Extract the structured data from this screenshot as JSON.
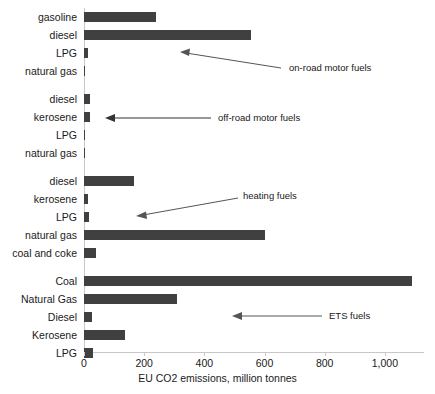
{
  "chart_data": {
    "type": "bar",
    "orientation": "horizontal",
    "title": "",
    "xlabel": "EU CO2 emissions, million tonnes",
    "ylabel": "",
    "xlim": [
      0,
      1130
    ],
    "xticks": [
      0,
      200,
      400,
      600,
      800,
      1000
    ],
    "xtick_labels": [
      "0",
      "200",
      "400",
      "600",
      "800",
      "1,000"
    ],
    "grid": false,
    "legend": null,
    "bar_color": "#404040",
    "axis_color": "#c8c8c8",
    "groups": [
      {
        "name": "on-road motor fuels",
        "categories": [
          "gasoline",
          "diesel",
          "LPG",
          "natural gas"
        ],
        "values": [
          240,
          555,
          12,
          3
        ]
      },
      {
        "name": "off-road motor fuels",
        "categories": [
          "diesel",
          "kerosene",
          "LPG",
          "natural gas"
        ],
        "values": [
          20,
          20,
          1,
          4
        ]
      },
      {
        "name": "heating fuels",
        "categories": [
          "diesel",
          "kerosene",
          "LPG",
          "natural gas",
          "coal and coke"
        ],
        "values": [
          165,
          13,
          16,
          600,
          40
        ]
      },
      {
        "name": "ETS fuels",
        "categories": [
          "Coal",
          "Natural Gas",
          "Diesel",
          "Kerosene",
          "LPG"
        ],
        "values": [
          1090,
          310,
          25,
          135,
          30
        ]
      }
    ],
    "categories": [
      "gasoline",
      "diesel",
      "LPG",
      "natural gas",
      "diesel",
      "kerosene",
      "LPG",
      "natural gas",
      "diesel",
      "kerosene",
      "LPG",
      "natural gas",
      "coal and coke",
      "Coal",
      "Natural Gas",
      "Diesel",
      "Kerosene",
      "LPG"
    ],
    "values": [
      240,
      555,
      12,
      3,
      20,
      20,
      1,
      4,
      165,
      13,
      16,
      600,
      40,
      1090,
      310,
      25,
      135,
      30
    ],
    "annotations": [
      {
        "text": "on-road motor fuels",
        "points_to": "LPG (on-road group)"
      },
      {
        "text": "off-road motor fuels",
        "points_to": "kerosene (off-road group)"
      },
      {
        "text": "heating fuels",
        "points_to": "LPG (heating group)"
      },
      {
        "text": "ETS fuels",
        "points_to": "Diesel (ETS group)"
      }
    ]
  }
}
